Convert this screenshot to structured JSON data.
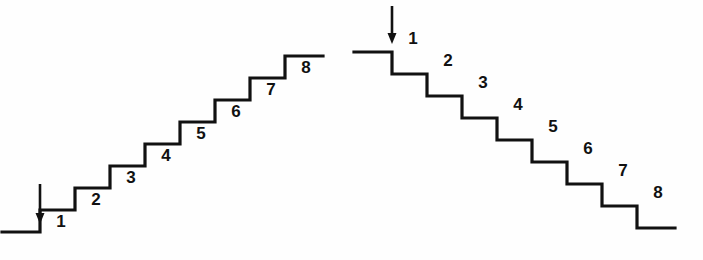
{
  "figure": {
    "background_color": "#fefefe",
    "line_color": "#111111",
    "label_color": "#111111",
    "stroke_width": 3.2,
    "width": 703,
    "height": 260
  },
  "staircases": [
    {
      "id": "ascending-staircase",
      "name": "left-ascending-staircase",
      "direction": "ascending",
      "description": "Staircase of 8 steps rising from lower-left to upper-right",
      "step_count": 8,
      "step_width": 35,
      "step_height": 22,
      "start_x": 40,
      "start_y": 232,
      "lead_in_length": 38,
      "lead_out_length": 38,
      "arrow": {
        "name": "down-arrow-left",
        "x": 40,
        "y_start": 184,
        "y_end": 224,
        "direction": "down",
        "head_width": 9,
        "head_length": 11
      },
      "labels": [
        {
          "text": "1",
          "x": 61,
          "y": 227
        },
        {
          "text": "2",
          "x": 96,
          "y": 205
        },
        {
          "text": "3",
          "x": 131,
          "y": 183
        },
        {
          "text": "4",
          "x": 166,
          "y": 161
        },
        {
          "text": "5",
          "x": 201,
          "y": 139
        },
        {
          "text": "6",
          "x": 236,
          "y": 117
        },
        {
          "text": "7",
          "x": 271,
          "y": 95
        },
        {
          "text": "8",
          "x": 306,
          "y": 73
        }
      ]
    },
    {
      "id": "descending-staircase",
      "name": "right-descending-staircase",
      "direction": "descending",
      "description": "Staircase of 8 steps falling from upper-left to lower-right",
      "step_count": 8,
      "step_width": 35,
      "step_height": 22,
      "start_x": 392,
      "start_y": 52,
      "lead_in_length": 38,
      "lead_out_length": 38,
      "arrow": {
        "name": "down-arrow-right",
        "x": 392,
        "y_start": 6,
        "y_end": 44,
        "direction": "down",
        "head_width": 9,
        "head_length": 11
      },
      "labels": [
        {
          "text": "1",
          "x": 413,
          "y": 44
        },
        {
          "text": "2",
          "x": 448,
          "y": 66
        },
        {
          "text": "3",
          "x": 483,
          "y": 88
        },
        {
          "text": "4",
          "x": 518,
          "y": 110
        },
        {
          "text": "5",
          "x": 553,
          "y": 132
        },
        {
          "text": "6",
          "x": 588,
          "y": 154
        },
        {
          "text": "7",
          "x": 623,
          "y": 176
        },
        {
          "text": "8",
          "x": 658,
          "y": 198
        }
      ]
    }
  ]
}
